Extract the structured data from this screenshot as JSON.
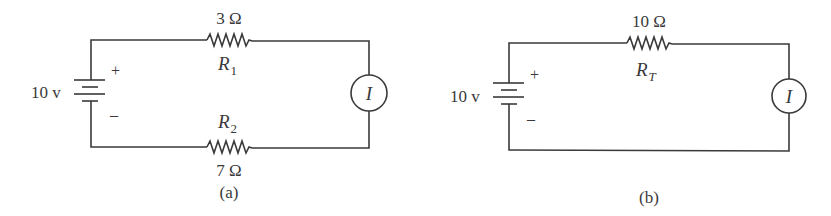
{
  "circuit_a": {
    "caption": "(a)",
    "source": {
      "voltage": "10 v",
      "plus": "+",
      "minus": "–"
    },
    "r1": {
      "value": "3 Ω",
      "name": "R",
      "sub": "1"
    },
    "r2": {
      "value": "7 Ω",
      "name": "R",
      "sub": "2"
    },
    "meter": {
      "label": "I"
    }
  },
  "circuit_b": {
    "caption": "(b)",
    "source": {
      "voltage": "10 v",
      "plus": "+",
      "minus": "–"
    },
    "rt": {
      "value": "10 Ω",
      "name": "R",
      "sub": "T"
    },
    "meter": {
      "label": "I"
    }
  }
}
